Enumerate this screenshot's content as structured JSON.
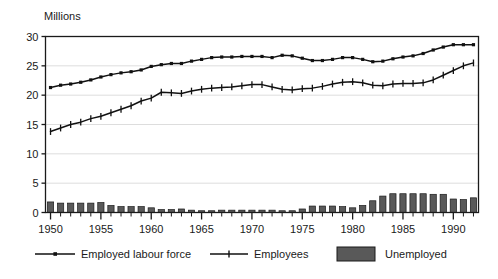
{
  "chart_data": {
    "type": "line",
    "title": "",
    "subtitle": "",
    "ylabel": "Millions",
    "xlabel": "",
    "ylim": [
      0,
      30
    ],
    "xlim": [
      1950,
      1992
    ],
    "yticks": [
      0,
      5,
      10,
      15,
      20,
      25,
      30
    ],
    "ytick_labels": [
      "0",
      "5",
      "10",
      "15",
      "20",
      "25",
      "30"
    ],
    "xticks": [
      1950,
      1955,
      1960,
      1965,
      1970,
      1975,
      1980,
      1985,
      1990
    ],
    "xtick_labels": [
      "1950",
      "1955",
      "1960",
      "1965",
      "1970",
      "1975",
      "1980",
      "1985",
      "1990"
    ],
    "minor_xticks_every": 1,
    "grid": "horizontal",
    "legend_position": "bottom",
    "x": [
      1950,
      1951,
      1952,
      1953,
      1954,
      1955,
      1956,
      1957,
      1958,
      1959,
      1960,
      1961,
      1962,
      1963,
      1964,
      1965,
      1966,
      1967,
      1968,
      1969,
      1970,
      1971,
      1972,
      1973,
      1974,
      1975,
      1976,
      1977,
      1978,
      1979,
      1980,
      1981,
      1982,
      1983,
      1984,
      1985,
      1986,
      1987,
      1988,
      1989,
      1990,
      1991,
      1992
    ],
    "series": [
      {
        "name": "Employed labour force",
        "marker": "square",
        "values": [
          21.3,
          21.7,
          21.9,
          22.2,
          22.6,
          23.1,
          23.5,
          23.8,
          24.0,
          24.3,
          24.9,
          25.2,
          25.4,
          25.4,
          25.8,
          26.1,
          26.4,
          26.5,
          26.5,
          26.6,
          26.6,
          26.6,
          26.4,
          26.8,
          26.7,
          26.3,
          25.9,
          25.9,
          26.1,
          26.4,
          26.4,
          26.1,
          25.7,
          25.8,
          26.2,
          26.5,
          26.7,
          27.1,
          27.7,
          28.2,
          28.6,
          28.6,
          28.6
        ]
      },
      {
        "name": "Employees",
        "marker": "plus",
        "values": [
          13.8,
          14.4,
          15.0,
          15.4,
          16.0,
          16.4,
          17.0,
          17.6,
          18.2,
          19.0,
          19.5,
          20.5,
          20.4,
          20.3,
          20.7,
          21.0,
          21.2,
          21.3,
          21.4,
          21.6,
          21.8,
          21.8,
          21.4,
          21.0,
          20.9,
          21.1,
          21.2,
          21.5,
          21.9,
          22.2,
          22.3,
          22.1,
          21.7,
          21.6,
          21.9,
          22.0,
          22.0,
          22.1,
          22.6,
          23.4,
          24.2,
          25.0,
          25.5
        ]
      }
    ],
    "bar_series": {
      "name": "Unemployed",
      "color": "#4d4d4d",
      "values": [
        1.8,
        1.6,
        1.6,
        1.6,
        1.6,
        1.7,
        1.2,
        1.0,
        1.0,
        1.0,
        0.8,
        0.5,
        0.5,
        0.6,
        0.4,
        0.3,
        0.3,
        0.4,
        0.4,
        0.4,
        0.4,
        0.4,
        0.4,
        0.3,
        0.3,
        0.6,
        1.1,
        1.1,
        1.1,
        1.0,
        0.8,
        1.2,
        2.0,
        2.8,
        3.2,
        3.2,
        3.2,
        3.2,
        3.1,
        3.1,
        2.3,
        2.2,
        2.5
      ]
    },
    "annotations": []
  },
  "legend": {
    "items": [
      {
        "label": "Employed labour force",
        "style": "line-square"
      },
      {
        "label": "Employees",
        "style": "line-plus"
      },
      {
        "label": "Unemployed",
        "style": "bar-swatch"
      }
    ]
  },
  "colors": {
    "line": "#111111",
    "bar_fill": "#595959",
    "bar_stroke": "#1a1a1a",
    "grid": "#d4d4d4",
    "axis": "#1a1a1a",
    "background": "#ffffff",
    "text": "#1a1a1a"
  }
}
